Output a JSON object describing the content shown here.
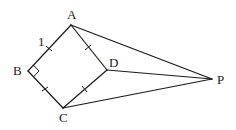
{
  "diagram": {
    "type": "geometry",
    "colors": {
      "stroke": "#1a1a1a",
      "background": "#ffffff"
    },
    "points": {
      "A": {
        "label": "A",
        "x": 71,
        "y": 25
      },
      "B": {
        "label": "B",
        "x": 28,
        "y": 71
      },
      "C": {
        "label": "C",
        "x": 63,
        "y": 108
      },
      "D": {
        "label": "D",
        "x": 107,
        "y": 70
      },
      "P": {
        "label": "P",
        "x": 212,
        "y": 79
      }
    },
    "segments": [
      "AB",
      "BC",
      "CD",
      "DA",
      "AP",
      "DP",
      "CP"
    ],
    "annotations": {
      "side_label": "1",
      "right_angle_at": "B",
      "equal_side_ticks": [
        "AB",
        "BC",
        "CD",
        "DA"
      ]
    }
  }
}
